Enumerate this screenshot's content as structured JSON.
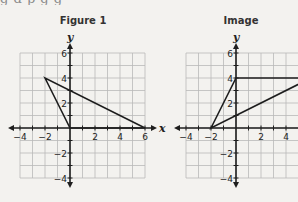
{
  "top_text_fragment": "g        d                p       g         g",
  "figures": [
    {
      "title": "Figure 1",
      "x_axis_label": "x",
      "y_axis_label": "y",
      "x_ticks": [
        "−4",
        "−2",
        "2",
        "4",
        "6"
      ],
      "y_ticks": [
        "6",
        "4",
        "2",
        "−2",
        "−4"
      ],
      "x_range": [
        -4,
        6
      ],
      "y_range": [
        -4,
        6
      ],
      "polygon": [
        [
          -2,
          4
        ],
        [
          0,
          0
        ],
        [
          6,
          0
        ]
      ]
    },
    {
      "title": "Image",
      "x_axis_label": "x",
      "y_axis_label": "y",
      "x_ticks": [
        "−4",
        "−2",
        "2",
        "4"
      ],
      "y_ticks": [
        "6",
        "4",
        "2",
        "−2",
        "−4"
      ],
      "x_range": [
        -4,
        6
      ],
      "y_range": [
        -4,
        6
      ],
      "polygon": [
        [
          -2,
          0
        ],
        [
          0,
          4
        ],
        [
          6,
          4
        ]
      ]
    }
  ],
  "colors": {
    "grid": "#b9b9b9",
    "axis": "#1e1e1e",
    "shape": "#1e1e1e",
    "background": "#f3f2ef"
  }
}
